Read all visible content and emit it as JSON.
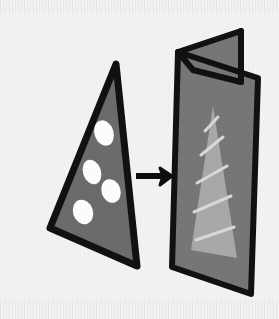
{
  "figure": {
    "background_color": "#f2f2f0",
    "outline_color": "#111111",
    "relation_label": "transforms into"
  },
  "source_shape": {
    "name": "dotted-triangle",
    "fill_color": "#6b6b6b",
    "outline_color": "#111111",
    "outline_width": 7,
    "points": "116,64 137,266 50,228",
    "dot_color": "#fdfdfb",
    "dot_count": 4,
    "dots": [
      {
        "cx": 104,
        "cy": 133,
        "rx": 9.5,
        "ry": 13.0,
        "rot": -18
      },
      {
        "cx": 92,
        "cy": 172,
        "rx": 9.0,
        "ry": 12.5,
        "rot": -18
      },
      {
        "cx": 111,
        "cy": 191,
        "rx": 9.5,
        "ry": 12.0,
        "rot": -18
      },
      {
        "cx": 83,
        "cy": 212,
        "rx": 10.0,
        "ry": 12.5,
        "rot": -18
      }
    ]
  },
  "arrow": {
    "name": "transformation-arrow",
    "color": "#0d0d0d",
    "direction": "right",
    "shaft": "136,176 166,176",
    "shaft_width": 6,
    "head": "172,176 160,168 163,176 160,185"
  },
  "target_shape": {
    "name": "folded-panel",
    "back_flap": {
      "fill_color": "#767676",
      "points": "178,52 241,31 241,82 193,70"
    },
    "front_panel": {
      "fill_color": "#767676",
      "points": "178,52 258,78 251,294 172,267"
    },
    "outline_color": "#111111",
    "outline_width": 6,
    "fold_crease": "241,31 241,82",
    "inner_triangle": {
      "name": "striped-triangle",
      "fill_color": "#a8a8a8",
      "points": "213,106 237,258 191,250"
    },
    "stripes": {
      "color": "#d8d8d8",
      "width": 3,
      "count": 5,
      "lines": [
        "196,240 234,227",
        "194,212 231,196",
        "197,183 227,166",
        "201,155 223,137",
        "205,131 218,117"
      ]
    }
  }
}
